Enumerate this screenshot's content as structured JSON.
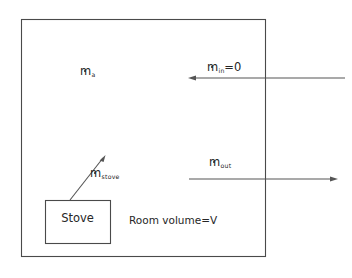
{
  "diagram": {
    "room": {
      "volume_label": "Room volume=V",
      "boundary_color": "#4a4a4a"
    },
    "stove": {
      "label": "Stove",
      "box_color": "#4a4a4a"
    },
    "flows": [
      {
        "id": "air",
        "symbol": "m",
        "subscript": "a",
        "equals": "",
        "full_label": "ṁa",
        "description": "room air mass rate"
      },
      {
        "id": "in",
        "symbol": "m",
        "subscript": "in",
        "equals": "=0",
        "full_label": "ṁin=0",
        "description": "inlet mass flow rate into room",
        "direction": "left"
      },
      {
        "id": "out",
        "symbol": "m",
        "subscript": "out",
        "equals": "",
        "full_label": "ṁout",
        "description": "outlet mass flow rate from room",
        "direction": "right"
      },
      {
        "id": "stove",
        "symbol": "m",
        "subscript": "stove",
        "equals": "",
        "full_label": "ṁstove",
        "description": "mass generation rate from stove",
        "direction": "up-right"
      }
    ],
    "colors": {
      "line": "#555555",
      "wall": "#4a4a4a",
      "text": "#262626",
      "background": "#ffffff"
    }
  }
}
